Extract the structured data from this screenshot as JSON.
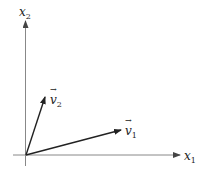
{
  "diagram": {
    "type": "vector-diagram",
    "axes": {
      "x_axis": {
        "name": "x",
        "subscript": "1"
      },
      "y_axis": {
        "name": "x",
        "subscript": "2"
      }
    },
    "vectors": [
      {
        "name": "v",
        "subscript": "1",
        "direction": "shallow, right"
      },
      {
        "name": "v",
        "subscript": "2",
        "direction": "steep, up-right"
      }
    ],
    "colors": {
      "axis": "#888888",
      "vector": "#222222",
      "text": "#222222"
    }
  }
}
